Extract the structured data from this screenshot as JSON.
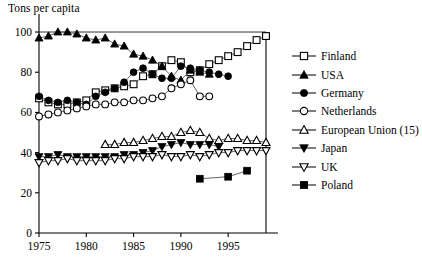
{
  "chart_data": {
    "type": "line",
    "title": "Tons per capita",
    "ylabel": "Tons per capita",
    "xlabel": "",
    "xlim": [
      1975,
      1999
    ],
    "ylim": [
      0,
      103
    ],
    "xticks": [
      1975,
      1980,
      1985,
      1990,
      1995
    ],
    "xtick_labels": [
      "1975",
      "1980",
      "1985",
      "1990",
      "1995"
    ],
    "yticks": [
      0,
      20,
      40,
      60,
      80,
      100
    ],
    "ytick_labels": [
      "0",
      "20",
      "40",
      "60",
      "80",
      "100"
    ],
    "grid": false,
    "legend_position": "right",
    "series": [
      {
        "name": "Finland",
        "marker": "open-square",
        "x": [
          1975,
          1976,
          1977,
          1978,
          1979,
          1980,
          1981,
          1982,
          1983,
          1984,
          1985,
          1986,
          1987,
          1988,
          1989,
          1990,
          1991,
          1992,
          1993,
          1994,
          1995,
          1996,
          1997,
          1998,
          1999
        ],
        "values": [
          67,
          65,
          64,
          64,
          65,
          66,
          70,
          71,
          72,
          73,
          74,
          78,
          79,
          83,
          86,
          85,
          80,
          81,
          84,
          86,
          88,
          90,
          93,
          96,
          98
        ]
      },
      {
        "name": "USA",
        "marker": "filled-triangle",
        "x": [
          1975,
          1976,
          1977,
          1978,
          1979,
          1980,
          1981,
          1982,
          1983,
          1984,
          1985,
          1986,
          1987,
          1988,
          1989,
          1990,
          1991,
          1992,
          1993
        ],
        "values": [
          97,
          98,
          100,
          100,
          99,
          97,
          96,
          97,
          94,
          93,
          89,
          88,
          86,
          83,
          78,
          76,
          81,
          80,
          79
        ]
      },
      {
        "name": "Germany",
        "marker": "filled-circle",
        "x": [
          1975,
          1976,
          1977,
          1978,
          1979,
          1980,
          1981,
          1982,
          1983,
          1984,
          1985,
          1986,
          1987,
          1988,
          1989,
          1990,
          1991,
          1992,
          1993,
          1994,
          1995
        ],
        "values": [
          68,
          66,
          65,
          66,
          65,
          64,
          68,
          70,
          72,
          75,
          80,
          82,
          79,
          77,
          77,
          83,
          82,
          81,
          80,
          79,
          78
        ]
      },
      {
        "name": "Netherlands",
        "marker": "open-circle",
        "x": [
          1975,
          1976,
          1977,
          1978,
          1979,
          1980,
          1981,
          1982,
          1983,
          1984,
          1985,
          1986,
          1987,
          1988,
          1989,
          1990,
          1991,
          1992,
          1993
        ],
        "values": [
          58,
          59,
          60,
          61,
          62,
          63,
          64,
          64,
          65,
          65,
          66,
          66,
          67,
          68,
          72,
          74,
          76,
          68,
          68
        ]
      },
      {
        "name": "European Union (15)",
        "marker": "open-triangle",
        "x": [
          1982,
          1983,
          1984,
          1985,
          1986,
          1987,
          1988,
          1989,
          1990,
          1991,
          1992,
          1993,
          1994,
          1995,
          1996,
          1997,
          1998,
          1999
        ],
        "values": [
          44,
          44,
          45,
          45,
          46,
          47,
          48,
          48,
          50,
          51,
          50,
          47,
          46,
          47,
          47,
          46,
          46,
          45
        ]
      },
      {
        "name": "Japan",
        "marker": "filled-down-triangle",
        "x": [
          1975,
          1976,
          1977,
          1978,
          1979,
          1980,
          1981,
          1982,
          1983,
          1984,
          1985,
          1986,
          1987,
          1988,
          1989,
          1990,
          1991,
          1992,
          1993,
          1994
        ],
        "values": [
          38,
          38,
          39,
          38,
          38,
          38,
          38,
          38,
          38,
          39,
          39,
          40,
          41,
          43,
          44,
          45,
          44,
          44,
          44,
          43
        ]
      },
      {
        "name": "UK",
        "marker": "open-down-triangle",
        "x": [
          1975,
          1976,
          1977,
          1978,
          1979,
          1980,
          1981,
          1982,
          1983,
          1984,
          1985,
          1986,
          1987,
          1988,
          1989,
          1990,
          1991,
          1992,
          1993,
          1994,
          1995,
          1996,
          1997,
          1998,
          1999
        ],
        "values": [
          35,
          36,
          36,
          37,
          36,
          36,
          36,
          36,
          37,
          37,
          38,
          38,
          38,
          39,
          38,
          38,
          39,
          38,
          39,
          40,
          40,
          41,
          41,
          41,
          41
        ]
      },
      {
        "name": "Poland",
        "marker": "filled-square",
        "x": [
          1992,
          1995,
          1997
        ],
        "values": [
          27,
          28,
          31
        ]
      }
    ]
  },
  "legend": {
    "items": [
      {
        "label": "Finland",
        "marker": "open-square"
      },
      {
        "label": "USA",
        "marker": "filled-triangle"
      },
      {
        "label": "Germany",
        "marker": "filled-circle"
      },
      {
        "label": "Netherlands",
        "marker": "open-circle"
      },
      {
        "label": "European Union (15)",
        "marker": "open-triangle"
      },
      {
        "label": "Japan",
        "marker": "filled-down-triangle"
      },
      {
        "label": "UK",
        "marker": "open-down-triangle"
      },
      {
        "label": "Poland",
        "marker": "filled-square"
      }
    ]
  },
  "colors": {
    "axis": "#000000",
    "marker": "#000000",
    "background": "#ffffff"
  }
}
